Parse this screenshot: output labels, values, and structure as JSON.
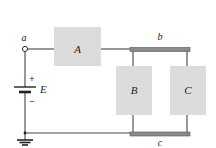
{
  "diagram": {
    "type": "circuit",
    "nodes": {
      "a": "a",
      "b": "b",
      "c": "c"
    },
    "source": {
      "label": "E",
      "plus": "+",
      "minus": "−"
    },
    "elements": [
      {
        "id": "A",
        "label": "A"
      },
      {
        "id": "B",
        "label": "B"
      },
      {
        "id": "C",
        "label": "C"
      }
    ],
    "colors": {
      "element_fill": "#dcdcdc",
      "wire": "#444444",
      "bus": "#7a7a7a"
    }
  }
}
